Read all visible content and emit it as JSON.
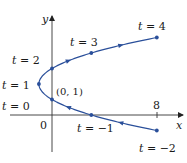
{
  "chart_data": {
    "type": "line",
    "title": "",
    "xlabel": "x",
    "ylabel": "y",
    "origin_label": "0",
    "x_ticks": [
      {
        "value": 8,
        "label": "8"
      }
    ],
    "point_annotation": {
      "x": 0,
      "y": 1,
      "label": "(0, 1)"
    },
    "points": [
      {
        "t": -2,
        "x": 8,
        "y": -1,
        "label": "t = −2"
      },
      {
        "t": -1,
        "x": 3,
        "y": 0,
        "label": "t = −1"
      },
      {
        "t": 0,
        "x": 0,
        "y": 1,
        "label": "t = 0"
      },
      {
        "t": 1,
        "x": -1,
        "y": 2,
        "label": "t = 1"
      },
      {
        "t": 2,
        "x": 0,
        "y": 3,
        "label": "t = 2"
      },
      {
        "t": 3,
        "x": 3,
        "y": 4,
        "label": "t = 3"
      },
      {
        "t": 4,
        "x": 8,
        "y": 5,
        "label": "t = 4"
      }
    ],
    "t_range": [
      -2,
      4
    ],
    "direction": "increasing t (arrows point from bottom-right toward top-right)",
    "curve_color": "#2a4f9a",
    "axis_color": "#333333",
    "grid": false,
    "legend": false
  }
}
